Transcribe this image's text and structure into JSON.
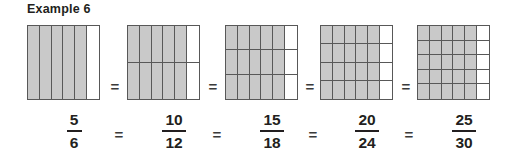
{
  "title": "Example 6",
  "colors": {
    "shaded_fill": "#c9c9c9",
    "unshaded_fill": "#ffffff",
    "grid_line": "#585858",
    "text": "#231f20",
    "background": "#ffffff"
  },
  "equals_symbol": "=",
  "diagram": {
    "figures": [
      {
        "label": "fraction-model-5-6",
        "columns": 6,
        "rows": 1,
        "total_cells": 6,
        "shaded_cells": 5,
        "left": 27
      },
      {
        "label": "fraction-model-10-12",
        "columns": 6,
        "rows": 2,
        "total_cells": 12,
        "shaded_cells": 10,
        "left": 127
      },
      {
        "label": "fraction-model-15-18",
        "columns": 6,
        "rows": 3,
        "total_cells": 18,
        "shaded_cells": 15,
        "left": 225
      },
      {
        "label": "fraction-model-20-24",
        "columns": 6,
        "rows": 4,
        "total_cells": 24,
        "shaded_cells": 20,
        "left": 320
      },
      {
        "label": "fraction-model-25-30",
        "columns": 6,
        "rows": 5,
        "total_cells": 30,
        "shaded_cells": 25,
        "left": 417
      }
    ],
    "equals_positions": [
      104,
      202,
      299,
      395
    ]
  },
  "fractions": [
    {
      "numerator": "5",
      "denominator": "6",
      "left": 45,
      "bar_width": "w2"
    },
    {
      "numerator": "10",
      "denominator": "12",
      "left": 145,
      "bar_width": "w3"
    },
    {
      "numerator": "15",
      "denominator": "18",
      "left": 243,
      "bar_width": "w3"
    },
    {
      "numerator": "20",
      "denominator": "24",
      "left": 338,
      "bar_width": "w3"
    },
    {
      "numerator": "25",
      "denominator": "30",
      "left": 435,
      "bar_width": "w3"
    }
  ],
  "fraction_equals_positions": [
    108,
    206,
    302,
    398
  ],
  "chart_data": {
    "type": "table",
    "title": "Example 6",
    "categories": [
      "5/6",
      "10/12",
      "15/18",
      "20/24",
      "25/30"
    ],
    "series": [
      {
        "name": "shaded_cells",
        "values": [
          5,
          10,
          15,
          20,
          25
        ]
      },
      {
        "name": "total_cells",
        "values": [
          6,
          12,
          18,
          24,
          30
        ]
      },
      {
        "name": "columns",
        "values": [
          6,
          6,
          6,
          6,
          6
        ]
      },
      {
        "name": "rows",
        "values": [
          1,
          2,
          3,
          4,
          5
        ]
      }
    ],
    "value": 0.8333,
    "xlabel": "",
    "ylabel": "",
    "legend": []
  }
}
